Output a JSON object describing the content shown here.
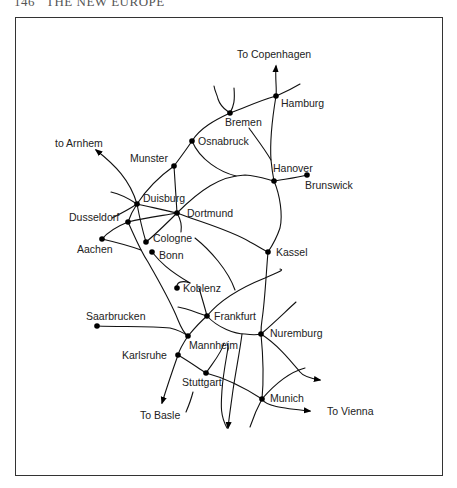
{
  "page": {
    "header": "146   THE NEW EUROPE"
  },
  "map": {
    "title": "German railway network",
    "cities": [
      {
        "name": "Hamburg",
        "x": 276,
        "y": 96
      },
      {
        "name": "Bremen",
        "x": 230,
        "y": 113
      },
      {
        "name": "Osnabruck",
        "x": 192,
        "y": 141
      },
      {
        "name": "Munster",
        "x": 174,
        "y": 166
      },
      {
        "name": "Hanover",
        "x": 274,
        "y": 181
      },
      {
        "name": "Brunswick",
        "x": 307,
        "y": 175
      },
      {
        "name": "Duisburg",
        "x": 137,
        "y": 204
      },
      {
        "name": "Dortmund",
        "x": 177,
        "y": 213
      },
      {
        "name": "Dusseldorf",
        "x": 128,
        "y": 222
      },
      {
        "name": "Aachen",
        "x": 102,
        "y": 239
      },
      {
        "name": "Cologne",
        "x": 146,
        "y": 242
      },
      {
        "name": "Bonn",
        "x": 152,
        "y": 252
      },
      {
        "name": "Kassel",
        "x": 268,
        "y": 252
      },
      {
        "name": "Koblenz",
        "x": 177,
        "y": 288
      },
      {
        "name": "Frankfurt",
        "x": 207,
        "y": 316
      },
      {
        "name": "Saarbrucken",
        "x": 97,
        "y": 326
      },
      {
        "name": "Mannheim",
        "x": 188,
        "y": 336
      },
      {
        "name": "Nuremburg",
        "x": 261,
        "y": 334
      },
      {
        "name": "Karlsruhe",
        "x": 178,
        "y": 355
      },
      {
        "name": "Stuttgart",
        "x": 206,
        "y": 373
      },
      {
        "name": "Munich",
        "x": 262,
        "y": 399
      }
    ],
    "labels": {
      "to_copenhagen": "To Copenhagen",
      "hamburg": "Hamburg",
      "bremen": "Bremen",
      "osnabruck": "Osnabruck",
      "to_arnhem": "to Arnhem",
      "munster": "Munster",
      "hanover": "Hanover",
      "brunswick": "Brunswick",
      "duisburg": "Duisburg",
      "dortmund": "Dortmund",
      "dusseldorf": "Dusseldorf",
      "aachen": "Aachen",
      "cologne": "Cologne",
      "bonn": "Bonn",
      "kassel": "Kassel",
      "koblenz": "Koblenz",
      "saarbrucken": "Saarbrucken",
      "frankfurt": "Frankfurt",
      "nuremburg": "Nuremburg",
      "mannheim": "Mannheim",
      "karlsruhe": "Karlsruhe",
      "stuttgart": "Stuttgart",
      "to_basle": "To Basle",
      "munich": "Munich",
      "to_vienna": "To Vienna"
    },
    "destinations": [
      "To Copenhagen",
      "to Arnhem",
      "To Basle",
      "To Vienna"
    ]
  }
}
